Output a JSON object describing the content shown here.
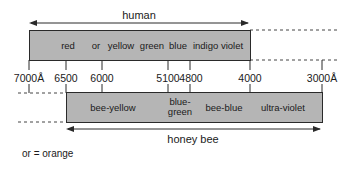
{
  "human": {
    "title": "human",
    "bar": {
      "x1": 29,
      "x2": 250,
      "y": 30,
      "h": 31
    },
    "bands": [
      {
        "label": "red",
        "x": 68
      },
      {
        "label": "or",
        "x": 96
      },
      {
        "label": "yellow",
        "x": 121
      },
      {
        "label": "green",
        "x": 152
      },
      {
        "label": "blue",
        "x": 178
      },
      {
        "label": "indigo violet",
        "x": 218
      }
    ]
  },
  "honey_bee": {
    "title": "honey bee",
    "bar": {
      "x1": 66,
      "x2": 322,
      "y": 92,
      "h": 31
    },
    "bands": [
      {
        "label": "bee-yellow",
        "x": 113
      },
      {
        "label": "blue-\ngreen",
        "x": 180
      },
      {
        "label": "bee-blue",
        "x": 224
      },
      {
        "label": "ultra-violet",
        "x": 283
      }
    ]
  },
  "wavelength_axis": {
    "ticks": [
      {
        "label": "7000Å",
        "x": 29
      },
      {
        "label": "6500",
        "x": 66
      },
      {
        "label": "6000",
        "x": 102
      },
      {
        "label": "5100",
        "x": 168
      },
      {
        "label": "4800",
        "x": 190
      },
      {
        "label": "4000",
        "x": 250
      },
      {
        "label": "3000Å",
        "x": 322
      }
    ]
  },
  "footnote": "or = orange",
  "colors": {
    "bar_fill": "#b5b5b5",
    "line": "#2a2a2a"
  }
}
